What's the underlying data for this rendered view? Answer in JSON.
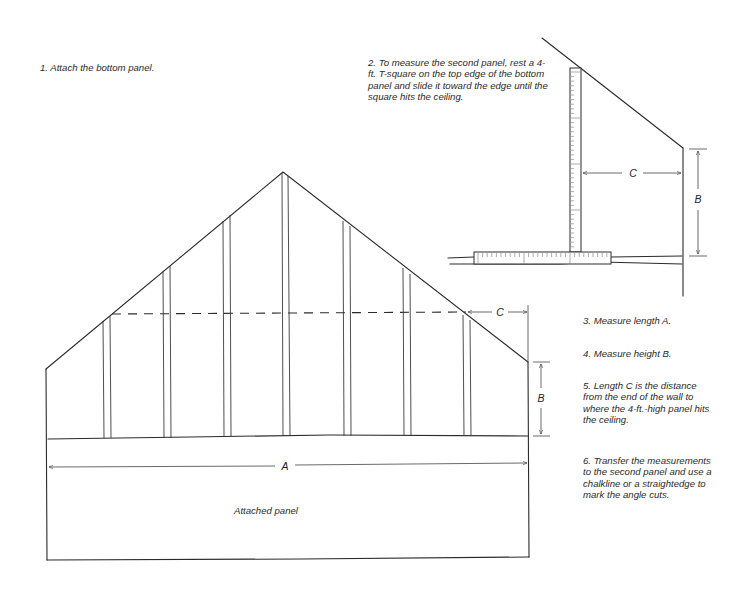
{
  "instructions": {
    "step1": "1. Attach the bottom panel.",
    "step2": "2. To measure the second panel, rest a 4-ft. T-square on the top edge of the bottom panel and slide it toward the edge until the square hits the ceiling.",
    "step3": "3. Measure length A.",
    "step4": "4. Measure height B.",
    "step5": "5. Length C is the distance from the end of the wall to where the 4-ft.-high panel hits the ceiling.",
    "step6": "6. Transfer the measurements to the second panel and use a chalkline or a straightedge to mark the angle cuts."
  },
  "main_drawing": {
    "panel_label": "Attached panel",
    "dimensions": {
      "length": "A",
      "height": "B",
      "offset": "C"
    },
    "stud_count": 7
  },
  "inset_drawing": {
    "tool": "4-ft. T-square",
    "dimensions": {
      "height": "B",
      "offset": "C"
    }
  },
  "colors": {
    "line": "#2b2b2b",
    "text": "#2a2a2a",
    "background": "#ffffff"
  }
}
